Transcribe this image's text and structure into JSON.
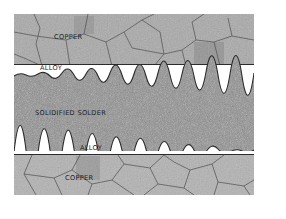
{
  "figure": {
    "layers": [
      {
        "id": "copper-top",
        "label": "COPPER",
        "texture": "grains",
        "color": "#a9a9a9"
      },
      {
        "id": "alloy-top",
        "label": "ALLOY",
        "texture": "plain",
        "color": "#ffffff"
      },
      {
        "id": "solder",
        "label": "SOLIDIFIED SOLDER",
        "texture": "speckle",
        "color": "#8f8f8f"
      },
      {
        "id": "alloy-bottom",
        "label": "ALLOY",
        "texture": "plain",
        "color": "#ffffff"
      },
      {
        "id": "copper-bottom",
        "label": "COPPER",
        "texture": "grains",
        "color": "#b2b2b2"
      }
    ],
    "colors": {
      "boundary_line": "#2b2b2b",
      "grain_border": "#5a5a5a",
      "label_text": "#1e1e1e"
    }
  }
}
